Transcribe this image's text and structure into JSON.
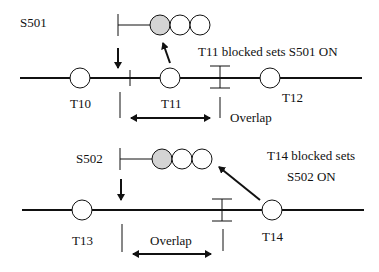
{
  "diagram": {
    "colors": {
      "line": "#111111",
      "signal_on": "#d4d4d4",
      "lamp": "#ffffff"
    },
    "top": {
      "signal_label": "S501",
      "track_circuits": [
        "T10",
        "T11",
        "T12"
      ],
      "annotation": "T11 blocked sets S501 ON",
      "overlap_label": "Overlap"
    },
    "bottom": {
      "signal_label": "S502",
      "track_circuits": [
        "T13",
        "T14"
      ],
      "annotation_line1": "T14 blocked sets",
      "annotation_line2": "S502 ON",
      "overlap_label": "Overlap"
    }
  }
}
